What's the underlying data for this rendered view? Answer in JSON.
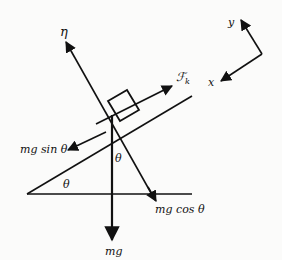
{
  "diagram": {
    "type": "free-body diagram on inclined plane",
    "colors": {
      "line": "#111111",
      "background": "#fbfbfa"
    },
    "labels": {
      "normal_force": "η",
      "friction_force": "ℱk",
      "friction_subscript": "k",
      "friction_main": "ℱ",
      "weight_parallel": "mg sin θ",
      "weight_perpendicular": "mg cos θ",
      "weight": "mg",
      "incline_angle": "θ",
      "block_angle": "θ",
      "axis_x": "x",
      "axis_y": "y"
    }
  }
}
